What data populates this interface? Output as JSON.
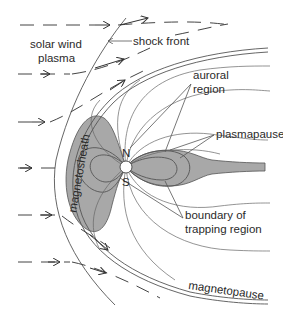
{
  "diagram": {
    "labels": {
      "solar_wind_line1": "solar wind",
      "solar_wind_line2": "plasma",
      "shock_front": "shock front",
      "auroral_line1": "auroral",
      "auroral_line2": "region",
      "plasmapause": "plasmapause",
      "boundary_line1": "boundary of",
      "boundary_line2": "trapping region",
      "magnetosheath": "magnetosheath",
      "magnetopause": "magnetopause",
      "north": "N",
      "south": "S"
    },
    "colors": {
      "trapping_region_fill": "#a8a8a8",
      "line": "#555555",
      "text": "#2a2a2a",
      "background": "#ffffff"
    }
  }
}
